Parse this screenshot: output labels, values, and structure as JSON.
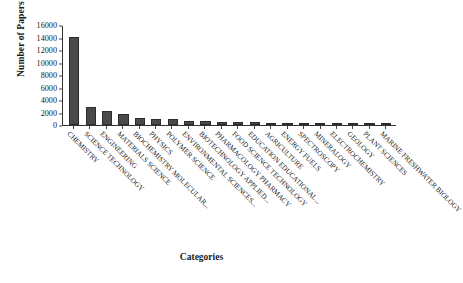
{
  "chart_data": {
    "type": "bar",
    "title": "",
    "xlabel": "Categories",
    "ylabel": "Number of Papers",
    "ylim": [
      0,
      16000
    ],
    "ytick_step": 2000,
    "grid": false,
    "legend": "none",
    "bar_color": "#4a4a4a",
    "label_rotation": 45,
    "yticks": [
      "16000",
      "14000",
      "12000",
      "10000",
      "8000",
      "6000",
      "4000",
      "2000",
      "0"
    ],
    "categories": [
      "CHEMISTRY",
      "SCIENCE TECHNOLOGY",
      "ENGINEERING",
      "MATERIALS SCIENCE",
      "BIOCHEMISTRY MOLECULAR...",
      "PHYSICS",
      "POLYMER SCIENCE",
      "ENVIRONMENTAL SCIENCES...",
      "BIOTECHNOLOGY APPLIED...",
      "PHARMACOLOGY PHARMACY",
      "FOOD SCIENCE TECHNOLOGY",
      "EDUCATION EDUCATIONAL...",
      "AGRICULTURE",
      "ENERGY FUELS",
      "SPECTROSCOPY",
      "MINERALOGY",
      "ELECTROCHEMISTRY",
      "GEOLOGY",
      "PLANT SCIENCES",
      "MARINE FRESHWATER BIOLOGY"
    ],
    "values": [
      14050,
      2900,
      2250,
      1800,
      1050,
      950,
      900,
      700,
      600,
      560,
      520,
      420,
      340,
      300,
      270,
      240,
      210,
      180,
      150,
      120
    ]
  }
}
